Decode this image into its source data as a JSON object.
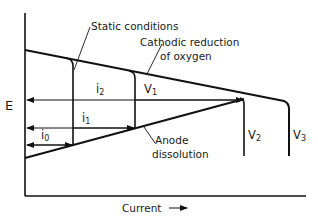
{
  "diagram": {
    "axes": {
      "y_label": "E",
      "x_label": "Current",
      "x_arrow": "→"
    },
    "curves": {
      "cathodic": "Cathodic reduction",
      "cathodic_line2": "of oxygen",
      "anodic": "Anode",
      "anodic_line2": "dissolution"
    },
    "annotations": {
      "static": "Static conditions"
    },
    "currents": [
      {
        "name": "i",
        "sub": "0"
      },
      {
        "name": "i",
        "sub": "1"
      },
      {
        "name": "i",
        "sub": "2"
      }
    ],
    "potentials": [
      {
        "name": "V",
        "sub": "1"
      },
      {
        "name": "V",
        "sub": "2"
      },
      {
        "name": "V",
        "sub": "3"
      }
    ],
    "colors": {
      "line": "#111111",
      "background": "#ffffff"
    }
  }
}
